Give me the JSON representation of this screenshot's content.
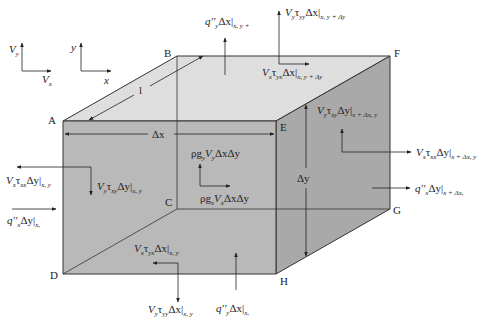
{
  "colors": {
    "front_face": "#b9b9b9",
    "top_face": "#dedede",
    "right_face": "#a9a9a9",
    "line": "#333333"
  },
  "axes": {
    "velocity": {
      "vertical": "V",
      "vertical_sub": "y",
      "horizontal": "V",
      "horizontal_sub": "x"
    },
    "coordinate": {
      "vertical": "y",
      "horizontal": "x"
    }
  },
  "corners": {
    "A": "A",
    "B": "B",
    "C": "C",
    "D": "D",
    "E": "E",
    "F": "F",
    "G": "G",
    "H": "H"
  },
  "dimensions": {
    "depth": "l",
    "width": "Δx",
    "height": "Δy"
  },
  "labels": {
    "top_heat_flux": {
      "main": "q′′",
      "sub1": "y",
      "mid": "Δx|",
      "sub2": "x, y +"
    },
    "top_normal_stress": {
      "main": "V",
      "sub1": "y",
      "mid": "τ",
      "sub_t": "yy",
      "rest": "Δx|",
      "sub2": "x, y + Δy"
    },
    "top_shear_stress": {
      "main": "V",
      "sub1": "x",
      "mid": "τ",
      "sub_t": "yx",
      "rest": "Δx|",
      "sub2": "x, y + Δy"
    },
    "right_shear_stress": {
      "main": "V",
      "sub1": "y",
      "mid": "τ",
      "sub_t": "xy",
      "rest": "Δy|",
      "sub2": "x + Δx, y"
    },
    "right_normal_stress": {
      "main": "V",
      "sub1": "x",
      "mid": "τ",
      "sub_t": "xx",
      "rest": "Δy|",
      "sub2": "x + Δx, y"
    },
    "right_heat_flux": {
      "main": "q′′",
      "sub1": "x",
      "rest": "Δy|",
      "sub2": "x + Δx,"
    },
    "left_normal_stress": {
      "main": "V",
      "sub1": "x",
      "mid": "τ",
      "sub_t": "xx",
      "rest": "Δy|",
      "sub2": "x, y"
    },
    "left_shear_stress": {
      "main": "V",
      "sub1": "y",
      "mid": "τ",
      "sub_t": "xy",
      "rest": "Δy|",
      "sub2": "x, y"
    },
    "left_heat_flux": {
      "main": "q′′",
      "sub1": "x",
      "rest": "Δy|",
      "sub2": "x,"
    },
    "body_force_y": {
      "pre": "ρg",
      "sub1": "y",
      "main": "V",
      "sub2": "y",
      "rest": "ΔxΔy"
    },
    "body_force_x": {
      "pre": "ρg",
      "sub1": "x",
      "main": "V",
      "sub2": "x",
      "rest": "ΔxΔy"
    },
    "bottom_shear_stress": {
      "main": "V",
      "sub1": "x",
      "mid": "τ",
      "sub_t": "yx",
      "rest": "Δx|",
      "sub2": "x, y"
    },
    "bottom_normal_stress": {
      "main": "V",
      "sub1": "y",
      "mid": "τ",
      "sub_t": "yy",
      "rest": "Δx|",
      "sub2": "x, y"
    },
    "bottom_heat_flux": {
      "main": "q′′",
      "sub1": "y",
      "rest": "Δx|",
      "sub2": "x,"
    }
  }
}
